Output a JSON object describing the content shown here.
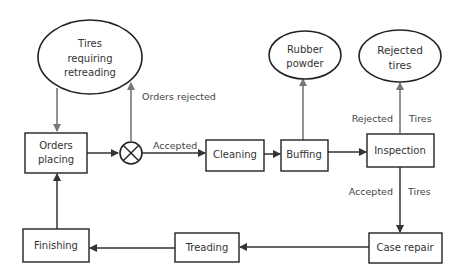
{
  "diagram": {
    "title": "",
    "nodes": {
      "tires_requiring": {
        "shape": "ellipse",
        "lines": [
          "Tires",
          "requiring",
          "retreading"
        ]
      },
      "rubber_powder": {
        "shape": "ellipse",
        "lines": [
          "Rubber",
          "powder"
        ]
      },
      "rejected_tires": {
        "shape": "ellipse",
        "lines": [
          "Rejected",
          "tires"
        ]
      },
      "orders_placing": {
        "shape": "box",
        "lines": [
          "Orders",
          "placing"
        ]
      },
      "junction": {
        "shape": "circle-x"
      },
      "cleaning": {
        "shape": "box",
        "lines": [
          "Cleaning"
        ]
      },
      "buffing": {
        "shape": "box",
        "lines": [
          "Buffing"
        ]
      },
      "inspection": {
        "shape": "box",
        "lines": [
          "Inspection"
        ]
      },
      "case_repair": {
        "shape": "box",
        "lines": [
          "Case repair"
        ]
      },
      "treading": {
        "shape": "box",
        "lines": [
          "Treading"
        ]
      },
      "finishing": {
        "shape": "box",
        "lines": [
          "Finishing"
        ]
      }
    },
    "edges": [
      {
        "from": "tires_requiring",
        "to": "orders_placing",
        "label": ""
      },
      {
        "from": "orders_placing",
        "to": "junction",
        "label": ""
      },
      {
        "from": "junction",
        "to": "tires_requiring",
        "label": "Orders rejected"
      },
      {
        "from": "junction",
        "to": "cleaning",
        "label": "Accepted"
      },
      {
        "from": "cleaning",
        "to": "buffing",
        "label": ""
      },
      {
        "from": "buffing",
        "to": "rubber_powder",
        "label": ""
      },
      {
        "from": "buffing",
        "to": "inspection",
        "label": ""
      },
      {
        "from": "inspection",
        "to": "rejected_tires",
        "label_left": "Rejected",
        "label_right": "Tires"
      },
      {
        "from": "inspection",
        "to": "case_repair",
        "label_left": "Accepted",
        "label_right": "Tires"
      },
      {
        "from": "case_repair",
        "to": "treading",
        "label": ""
      },
      {
        "from": "treading",
        "to": "finishing",
        "label": ""
      },
      {
        "from": "finishing",
        "to": "orders_placing",
        "label": ""
      }
    ],
    "colors": {
      "line_dark": "#333333",
      "line_gray": "#777777",
      "text": "#333333"
    }
  }
}
